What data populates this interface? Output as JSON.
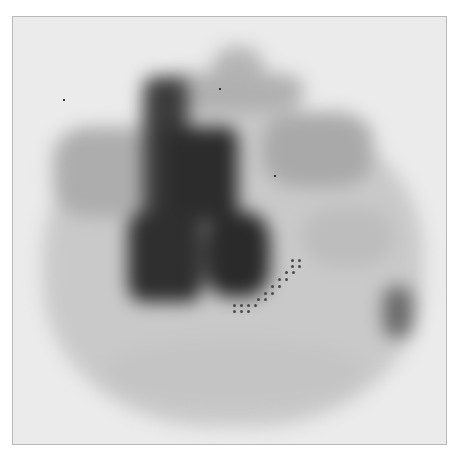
{
  "image": {
    "kind": "grayscale scintigraphy scan",
    "background_color": "#ebebeb",
    "frame_border_color": "#b8b8b8",
    "regions": [
      {
        "id": "outer-halo",
        "x": 30,
        "y": 90,
        "w": 380,
        "h": 320,
        "color": "#c9c9c9",
        "radius": "45%"
      },
      {
        "id": "top-cap",
        "x": 200,
        "y": 30,
        "w": 50,
        "h": 45,
        "color": "#b5b5b5",
        "radius": "40%"
      },
      {
        "id": "upper-band",
        "x": 140,
        "y": 55,
        "w": 150,
        "h": 40,
        "color": "#b0b0b0",
        "radius": "30%"
      },
      {
        "id": "left-wing",
        "x": 40,
        "y": 110,
        "w": 100,
        "h": 90,
        "color": "#adadad",
        "radius": "35%"
      },
      {
        "id": "right-wing",
        "x": 250,
        "y": 95,
        "w": 110,
        "h": 75,
        "color": "#a9a9a9",
        "radius": "35%"
      },
      {
        "id": "right-lower",
        "x": 290,
        "y": 190,
        "w": 90,
        "h": 60,
        "color": "#bdbdbd",
        "radius": "40%"
      },
      {
        "id": "vertical-column",
        "x": 130,
        "y": 60,
        "w": 45,
        "h": 150,
        "color": "#3c3c3c",
        "radius": "15%"
      },
      {
        "id": "central-mass",
        "x": 150,
        "y": 110,
        "w": 75,
        "h": 95,
        "color": "#2c2c2c",
        "radius": "15%"
      },
      {
        "id": "lower-left-lobe",
        "x": 115,
        "y": 195,
        "w": 75,
        "h": 90,
        "color": "#2f2f2f",
        "radius": "20%"
      },
      {
        "id": "lower-right-lobe",
        "x": 192,
        "y": 195,
        "w": 65,
        "h": 85,
        "color": "#2a2a2a",
        "radius": "35%"
      },
      {
        "id": "right-spot",
        "x": 370,
        "y": 270,
        "w": 30,
        "h": 50,
        "color": "#6a6a6a",
        "radius": "30%"
      },
      {
        "id": "bottom-arc",
        "x": 90,
        "y": 320,
        "w": 260,
        "h": 70,
        "color": "#c4c4c4",
        "radius": "50%"
      }
    ],
    "marker_dots": [
      [
        290,
        258
      ],
      [
        297,
        258
      ],
      [
        290,
        264
      ],
      [
        297,
        264
      ],
      [
        284,
        270
      ],
      [
        291,
        270
      ],
      [
        277,
        277
      ],
      [
        284,
        277
      ],
      [
        270,
        284
      ],
      [
        277,
        284
      ],
      [
        263,
        291
      ],
      [
        270,
        291
      ],
      [
        256,
        297
      ],
      [
        263,
        297
      ],
      [
        232,
        303
      ],
      [
        239,
        303
      ],
      [
        246,
        303
      ],
      [
        253,
        303
      ],
      [
        232,
        309
      ],
      [
        239,
        309
      ],
      [
        246,
        309
      ]
    ],
    "specks": [
      [
        218,
        87
      ],
      [
        273,
        174
      ],
      [
        62,
        98
      ]
    ]
  }
}
